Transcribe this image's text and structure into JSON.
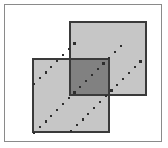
{
  "figure": {
    "canvas": {
      "width": 168,
      "height": 148,
      "background": "#ffffff"
    },
    "frame": {
      "label": "outer border frame",
      "x": 4.5,
      "y": 4.5,
      "width": 157,
      "height": 137,
      "stroke": "#8a8a8a",
      "stroke_width": 1.4,
      "fill": "#ffffff"
    },
    "squares": [
      {
        "id": "upper-right-square",
        "label": "Upper right square",
        "x": 69,
        "y": 21,
        "width": 78,
        "height": 75,
        "fill": "#c6c6c6",
        "stroke": "#3a3a3a",
        "stroke_width": 1.6
      },
      {
        "id": "lower-left-square",
        "label": "Lower left square",
        "x": 32,
        "y": 58,
        "width": 78,
        "height": 75,
        "fill": "#c6c6c6",
        "stroke": "#3a3a3a",
        "stroke_width": 1.6
      }
    ],
    "intersection": {
      "id": "overlap-region",
      "label": "Intersection of the two squares",
      "x": 69,
      "y": 58,
      "width": 41,
      "height": 38,
      "fill": "#818181",
      "stroke": "#3a3a3a",
      "stroke_width": 1.6
    },
    "diagonals": [
      {
        "id": "diagonal-lower",
        "label": "Lower dotted diagonal",
        "x1": 34,
        "y1": 133,
        "x2": 121,
        "y2": 46,
        "dot_size": 2.2,
        "dot_spacing": 8.2,
        "color": "#2e2e2e",
        "angle_deg": 45
      },
      {
        "id": "diagonal-upper",
        "label": "Upper dotted diagonal",
        "x1": 71,
        "y1": 131,
        "x2": 146,
        "y2": 56,
        "dot_size": 2.2,
        "dot_spacing": 8.2,
        "color": "#2e2e2e",
        "angle_deg": 45
      },
      {
        "id": "diagonal-topleft",
        "label": "Top left dotted diagonal continuation",
        "x1": 34,
        "y1": 84,
        "x2": 77,
        "y2": 41,
        "dot_size": 2.2,
        "dot_spacing": 8.2,
        "color": "#2e2e2e",
        "angle_deg": 45
      }
    ],
    "colors": {
      "light_fill": "#c6c6c6",
      "dark_fill": "#818181",
      "outline": "#3a3a3a",
      "frame": "#8a8a8a",
      "dot": "#2e2e2e",
      "background": "#ffffff"
    }
  }
}
